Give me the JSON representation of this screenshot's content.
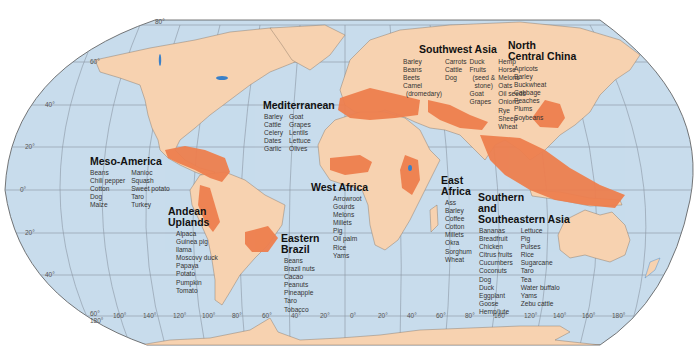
{
  "map": {
    "title": "Centers of plant and animal domestication",
    "colors": {
      "ocean": "#c8dcec",
      "land": "#f7d2b0",
      "hearth": "#ee7f4e",
      "border": "#7a6a5a",
      "graticule": "#8a96a3",
      "lakes": "#3a80c8"
    },
    "latitude_labels": {
      "n80": "80°",
      "n60": "60°",
      "n40": "40°",
      "n20": "20°",
      "eq": "0°",
      "s20": "20°",
      "s40": "40°",
      "s60": "60°"
    },
    "longitude_labels": [
      "180°",
      "160°",
      "140°",
      "120°",
      "100°",
      "80°",
      "60°",
      "40°",
      "20°",
      "0°",
      "20°",
      "40°",
      "60°",
      "80°",
      "100°",
      "120°",
      "140°",
      "160°",
      "180°"
    ]
  },
  "regions": {
    "meso_america": {
      "title": "Meso-America",
      "col1": [
        "Beans",
        "Chili pepper",
        "Cotton",
        "Dog",
        "Maize"
      ],
      "col2": [
        "Manioc",
        "Squash",
        "Sweet potato",
        "Taro",
        "Turkey"
      ]
    },
    "andean_uplands": {
      "title_line1": "Andean",
      "title_line2": "Uplands",
      "col1": [
        "Alpaca",
        "Guinea pig",
        "llama",
        "Moscovy duck",
        "Papaya",
        "Potato",
        "Pumpkin",
        "Tomato"
      ]
    },
    "eastern_brazil": {
      "title_line1": "Eastern",
      "title_line2": "Brazil",
      "col1": [
        "Beans",
        "Brazil nuts",
        "Cacao",
        "Peanuts",
        "Pineapple",
        "Taro",
        "Tobacco"
      ]
    },
    "mediterranean": {
      "title": "Mediterranean",
      "col1": [
        "Barley",
        "Cattle",
        "Celery",
        "Dates",
        "Garlic"
      ],
      "col2": [
        "Goat",
        "Grapes",
        "Lentils",
        "Lettuce",
        "Olives"
      ]
    },
    "west_africa": {
      "title": "West Africa",
      "col1": [
        "Arrowroot",
        "Gourds",
        "Melons",
        "Millets",
        "Pig",
        "Oil palm",
        "Rice",
        "Yams"
      ]
    },
    "east_africa": {
      "title_line1": "East",
      "title_line2": "Africa",
      "col1": [
        "Ass",
        "Barley",
        "Coffee",
        "Cotton",
        "Millets",
        "Okra",
        "Sorghum",
        "Wheat"
      ]
    },
    "southwest_asia": {
      "title": "Southwest Asia",
      "col1": [
        "Barley",
        "Beans",
        "Beets",
        "Camel",
        "(dromedary)"
      ],
      "col2": [
        "Carrots",
        "Cattle",
        "Dog"
      ],
      "col3": [
        "Duck",
        "Fruits",
        "(seed &",
        "stone)",
        "Goat",
        "Grapes"
      ],
      "col4": [
        "Hemp",
        "Horse",
        "Melons",
        "Oats",
        "Oil seeds",
        "Onions",
        "Rye",
        "Sheep",
        "Wheat"
      ]
    },
    "north_central_china": {
      "title_line1": "North",
      "title_line2": "Central China",
      "col1": [
        "Apricots",
        "Barley",
        "Buckwheat",
        "Cabbage",
        "Peaches",
        "Plums",
        "Soybeans"
      ]
    },
    "southern_southeastern_asia": {
      "title_line1": "Southern",
      "title_line2": "and",
      "title_line3": "Southeastern Asia",
      "col1": [
        "Bananas",
        "Breadfruit",
        "Chicken",
        "Citrus fruits",
        "Cucumbers",
        "Coconuts",
        "Dog",
        "Duck",
        "Eggplant",
        "Goose",
        "Hemp/jute"
      ],
      "col2": [
        "Lettuce",
        "Pig",
        "Pulses",
        "Rice",
        "Sugarcane",
        "Taro",
        "Tea",
        "Water buffalo",
        "Yams",
        "Zebu cattle"
      ]
    }
  }
}
